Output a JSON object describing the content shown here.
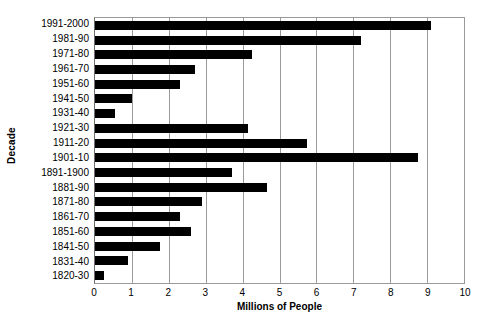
{
  "chart_data": {
    "type": "bar",
    "orientation": "horizontal",
    "title": "",
    "xlabel": "Millions of People",
    "ylabel": "Decade",
    "xlim": [
      0,
      10
    ],
    "xticks": [
      0,
      1,
      2,
      3,
      4,
      5,
      6,
      7,
      8,
      9,
      10
    ],
    "grid": true,
    "legend": null,
    "bar_color": "#000000",
    "categories": [
      "1991-2000",
      "1981-90",
      "1971-80",
      "1961-70",
      "1951-60",
      "1941-50",
      "1931-40",
      "1921-30",
      "1911-20",
      "1901-10",
      "1891-1900",
      "1881-90",
      "1871-80",
      "1861-70",
      "1851-60",
      "1841-50",
      "1831-40",
      "1820-30"
    ],
    "values": [
      9.1,
      7.2,
      4.25,
      2.7,
      2.3,
      1.0,
      0.55,
      4.15,
      5.75,
      8.75,
      3.7,
      4.65,
      2.9,
      2.3,
      2.6,
      1.75,
      0.9,
      0.25
    ]
  }
}
